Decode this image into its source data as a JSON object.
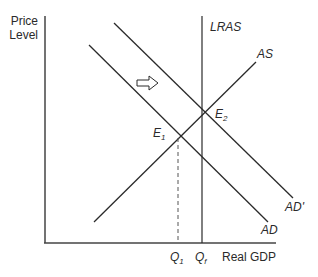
{
  "axes": {
    "y_label_line1": "Price",
    "y_label_line2": "Level",
    "x_label": "Real GDP"
  },
  "curves": {
    "lras": "LRAS",
    "as": "AS",
    "ad": "AD",
    "ad_prime": "AD'"
  },
  "points": {
    "e1": "E",
    "e1_sub": "1",
    "e2": "E",
    "e2_sub": "2"
  },
  "ticks": {
    "q1": "Q",
    "q1_sub": "1",
    "qf": "Q",
    "qf_sub": "f"
  },
  "shift_arrow": "right-arrow",
  "colors": {
    "line": "#2a2a2a",
    "dash": "#555555"
  }
}
